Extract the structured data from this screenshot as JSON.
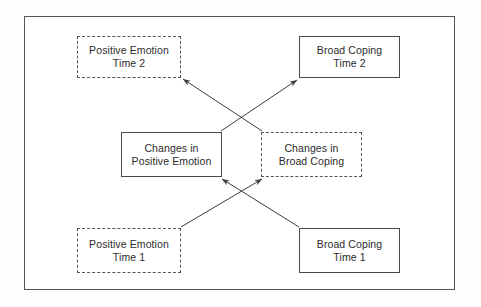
{
  "diagram": {
    "type": "cross-lagged-panel-path-model",
    "background_color": "#ffffff",
    "frame_color": "#555555",
    "line_color": "#4a4a4a",
    "text_color": "#2b2b2b",
    "nodes": [
      {
        "id": "positive-emotion-time-2",
        "line1": "Positive Emotion",
        "line2": "Time 2",
        "border": "dashed"
      },
      {
        "id": "broad-coping-time-2",
        "line1": "Broad Coping",
        "line2": "Time 2",
        "border": "solid"
      },
      {
        "id": "changes-in-positive-emotion",
        "line1": "Changes in",
        "line2": "Positive Emotion",
        "border": "solid"
      },
      {
        "id": "changes-in-broad-coping",
        "line1": "Changes in",
        "line2": "Broad Coping",
        "border": "dashed"
      },
      {
        "id": "positive-emotion-time-1",
        "line1": "Positive Emotion",
        "line2": "Time 1",
        "border": "dashed"
      },
      {
        "id": "broad-coping-time-1",
        "line1": "Broad Coping",
        "line2": "Time 1",
        "border": "solid"
      }
    ],
    "arrows": [
      {
        "id": "changes-broad-coping-to-positive-emotion-time-2",
        "from": "changes-in-broad-coping",
        "to": "positive-emotion-time-2",
        "style": "solid-single-head"
      },
      {
        "id": "changes-positive-emotion-to-broad-coping-time-2",
        "from": "changes-in-positive-emotion",
        "to": "broad-coping-time-2",
        "style": "solid-single-head"
      },
      {
        "id": "positive-emotion-time-1-to-changes-broad-coping",
        "from": "positive-emotion-time-1",
        "to": "changes-in-broad-coping",
        "style": "solid-single-head"
      },
      {
        "id": "broad-coping-time-1-to-changes-positive-emotion",
        "from": "broad-coping-time-1",
        "to": "changes-in-positive-emotion",
        "style": "solid-single-head"
      }
    ]
  }
}
